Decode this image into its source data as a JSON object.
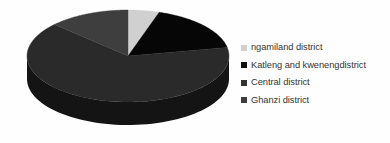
{
  "chart_data": {
    "type": "pie",
    "title": "",
    "three_d": true,
    "legend_position": "right",
    "categories": [
      "ngamiland district",
      "Katleng and kwenengdistrict",
      "Central district",
      "Ghanzi district"
    ],
    "values": [
      5,
      17,
      65,
      13
    ],
    "colors": [
      "#d0d0d0",
      "#060606",
      "#2a2a2a",
      "#3e3e3e"
    ],
    "slices": [
      {
        "label": "ngamiland district",
        "value": 5,
        "color": "#d0d0d0",
        "side_color": "#8f8f8f"
      },
      {
        "label": "Katleng and kwenengdistrict",
        "value": 17,
        "color": "#060606",
        "side_color": "#000000"
      },
      {
        "label": "Central district",
        "value": 65,
        "color": "#2a2a2a",
        "side_color": "#141414"
      },
      {
        "label": "Ghanzi district",
        "value": 13,
        "color": "#3e3e3e",
        "side_color": "#242424"
      }
    ]
  },
  "legend": {
    "items": [
      {
        "label": "ngamiland district",
        "color": "#d0d0d0"
      },
      {
        "label": "Katleng and kwenengdistrict",
        "color": "#111111"
      },
      {
        "label": "Central district",
        "color": "#333333"
      },
      {
        "label": "Ghanzi district",
        "color": "#3d3d3d"
      }
    ]
  },
  "canvas": {
    "background": "#fefefe"
  }
}
